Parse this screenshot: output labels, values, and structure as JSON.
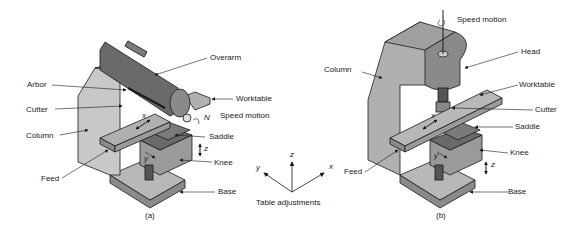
{
  "figure_a": {
    "caption": "(a)",
    "labels": {
      "overarm": "Overarm",
      "arbor": "Arbor",
      "cutter": "Cutter",
      "worktable": "Worktable",
      "speed_motion": "Speed motion",
      "speed_symbol": "N",
      "column": "Column",
      "saddle": "Saddle",
      "knee": "Knee",
      "feed": "Feed",
      "base": "Base",
      "axis_x": "x",
      "axis_y": "y",
      "axis_z": "z"
    }
  },
  "figure_b": {
    "caption": "(b)",
    "labels": {
      "speed_motion": "Speed motion",
      "head": "Head",
      "column": "Column",
      "worktable": "Worktable",
      "cutter": "Cutter",
      "saddle": "Saddle",
      "knee": "Knee",
      "feed": "Feed",
      "base": "Base",
      "axis_x": "x",
      "axis_y": "y",
      "axis_z": "z"
    }
  },
  "table_adjustments": {
    "title": "Table adjustments",
    "axis_x": "x",
    "axis_y": "y",
    "axis_z": "z"
  },
  "colors": {
    "body_light": "#c4c4c4",
    "body_mid": "#9a9a9a",
    "body_dark": "#5a5a5a",
    "outline": "#1a1a1a"
  }
}
